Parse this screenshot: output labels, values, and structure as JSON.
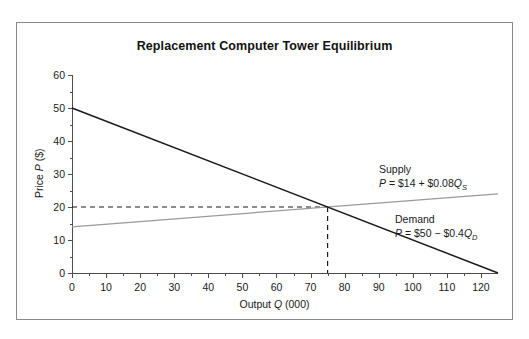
{
  "chart_data": {
    "type": "line",
    "title": "Replacement Computer Tower Equilibrium",
    "xlabel_parts": {
      "pre": "Output ",
      "var": "Q",
      "post": " (000)"
    },
    "ylabel_parts": {
      "pre": "Price ",
      "var": "P",
      "post": " ($)"
    },
    "xlim": [
      0,
      125
    ],
    "ylim": [
      0,
      60
    ],
    "xticks": [
      0,
      10,
      20,
      30,
      40,
      50,
      60,
      70,
      80,
      90,
      100,
      110,
      120
    ],
    "yticks": [
      0,
      10,
      20,
      30,
      40,
      50,
      60
    ],
    "grid": false,
    "legend": "inline-annotations",
    "series": [
      {
        "name": "Demand",
        "equation_text": "P = $50 - $0.4Q_D",
        "intercept": 50,
        "slope": -0.4,
        "color": "#1a1a1a",
        "points": [
          {
            "x": 0,
            "y": 50
          },
          {
            "x": 125,
            "y": 0
          }
        ]
      },
      {
        "name": "Supply",
        "equation_text": "P = $14 + $0.08Q_S",
        "intercept": 14,
        "slope": 0.08,
        "color": "#9a9a9a",
        "points": [
          {
            "x": 0,
            "y": 14
          },
          {
            "x": 125,
            "y": 24
          }
        ]
      }
    ],
    "equilibrium": {
      "x": 75,
      "y": 20,
      "guide_style": "dashed"
    },
    "annotations": [
      {
        "label": "Supply",
        "eq_pre": "P",
        "eq_mid": " = $14 + $0.08",
        "eq_var": "Q",
        "eq_sub": "S"
      },
      {
        "label": "Demand",
        "eq_pre": "P",
        "eq_mid": " = $50 − $0.4",
        "eq_var": "Q",
        "eq_sub": "D"
      }
    ]
  },
  "colors": {
    "demand": "#1a1a1a",
    "supply": "#9a9a9a",
    "axis": "#4c4c4c",
    "border": "#8a8a8a",
    "dashed": "#1a1a1a"
  }
}
